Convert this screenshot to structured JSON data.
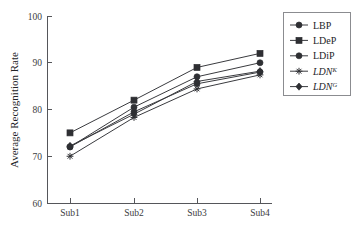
{
  "chart_data": {
    "type": "line",
    "title": "",
    "xlabel": "",
    "ylabel": "Average Recognition Rate",
    "categories": [
      "Sub1",
      "Sub2",
      "Sub3",
      "Sub4"
    ],
    "ylim": [
      60,
      100
    ],
    "yticks": [
      60,
      70,
      80,
      90,
      100
    ],
    "xticks": [
      "Sub1",
      "Sub2",
      "Sub3",
      "Sub4"
    ],
    "grid": false,
    "legend_position": "right",
    "series": [
      {
        "name": "LBP",
        "marker": "circle",
        "values": [
          72.0,
          80.5,
          87.0,
          90.0
        ]
      },
      {
        "name": "LDeP",
        "marker": "square",
        "values": [
          75.0,
          82.0,
          89.0,
          92.0
        ]
      },
      {
        "name": "LDiP",
        "marker": "circle",
        "values": [
          72.0,
          79.5,
          85.5,
          88.0
        ]
      },
      {
        "name": "LDN^K",
        "marker": "star",
        "values": [
          70.0,
          78.3,
          84.4,
          87.4
        ]
      },
      {
        "name": "LDN^G",
        "marker": "diamond",
        "values": [
          72.2,
          79.0,
          86.0,
          88.2
        ]
      }
    ]
  },
  "axes": {
    "y_title": "Average Recognition Rate",
    "y_tick_labels": [
      "100",
      "90",
      "80",
      "70",
      "60"
    ],
    "x_tick_labels": [
      "Sub1",
      "Sub2",
      "Sub3",
      "Sub4"
    ]
  },
  "legend": {
    "entries": [
      {
        "label": "LBP",
        "base": "LBP",
        "sup": "",
        "italic": false,
        "marker": "circle"
      },
      {
        "label": "LDeP",
        "base": "LDeP",
        "sup": "",
        "italic": false,
        "marker": "square"
      },
      {
        "label": "LDiP",
        "base": "LDiP",
        "sup": "",
        "italic": false,
        "marker": "circle"
      },
      {
        "label": "LDN^K",
        "base": "LDN",
        "sup": "K",
        "italic": true,
        "marker": "star"
      },
      {
        "label": "LDN^G",
        "base": "LDN",
        "sup": "G",
        "italic": true,
        "marker": "diamond"
      }
    ]
  },
  "colors": {
    "line": "#3a3b3f",
    "marker": "#2e2f33",
    "axis": "#55565a",
    "text": "#232428",
    "background": "#ffffff"
  }
}
